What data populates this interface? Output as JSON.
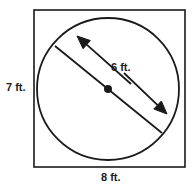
{
  "figure": {
    "type": "geometry-diagram",
    "colors": {
      "stroke": "#1a1a1a",
      "background": "#ffffff",
      "text": "#1a1a1a"
    },
    "labels": {
      "left": "7 ft.",
      "bottom": "8 ft.",
      "diameter": "6 ft."
    },
    "shapes": {
      "square": {
        "name": "bounding-rectangle",
        "x": 34,
        "y": 10,
        "width": 151,
        "height": 157,
        "width_label": "8 ft.",
        "height_label": "7 ft."
      },
      "circle": {
        "name": "inscribed-circle",
        "cx": 108,
        "cy": 89,
        "r": 71,
        "diameter_label": "6 ft."
      },
      "chord": {
        "name": "diameter-chord",
        "x1": 55,
        "y1": 46,
        "x2": 162,
        "y2": 133
      },
      "center_dot": {
        "name": "circle-center-point",
        "cx": 108,
        "cy": 89,
        "r": 4
      },
      "arrow_upper_left": {
        "name": "dimension-arrow-upper-left",
        "tail_x": 131,
        "tail_y": 84,
        "head_x": 77,
        "head_y": 36
      },
      "arrow_lower_right": {
        "name": "dimension-arrow-lower-right",
        "tail_x": 124,
        "tail_y": 73,
        "head_x": 167,
        "head_y": 114
      }
    }
  }
}
